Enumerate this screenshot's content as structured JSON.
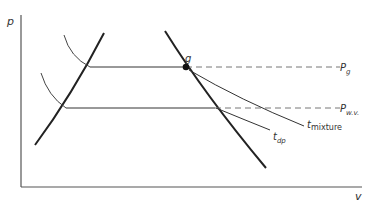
{
  "diagram": {
    "axes": {
      "y_label": "p",
      "x_label": "v"
    },
    "point": {
      "label": "g"
    },
    "pressure_lines": [
      {
        "label": "P",
        "subscript": "g"
      },
      {
        "label": "P",
        "subscript": "w.v."
      }
    ],
    "isotherms": [
      {
        "label": "t",
        "subscript": "mixture"
      },
      {
        "label": "t",
        "subscript": "dp"
      }
    ],
    "colors": {
      "line": "#222222",
      "thin_line": "#444444",
      "dashed": "#666666",
      "background": "#ffffff"
    }
  }
}
